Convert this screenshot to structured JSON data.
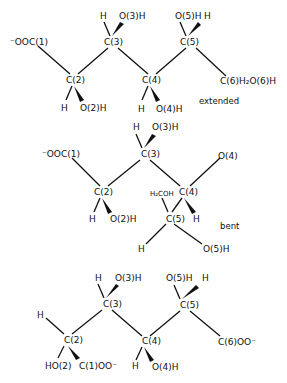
{
  "figure": {
    "structures": [
      {
        "id": "extended",
        "caption": "extended",
        "labels": {
          "c1": "⁻OOC(1)",
          "c2": "C(2)",
          "c3": "C(3)",
          "c4": "C(4)",
          "c5": "C(5)",
          "c6": "C(6)H₂O(6)H",
          "h2": "H",
          "o2": "O(2)H",
          "h3": "H",
          "o3": "O(3)H",
          "h4": "H",
          "o4": "O(4)H",
          "o5": "O(5)H",
          "h5": "H"
        }
      },
      {
        "id": "bent",
        "caption": "bent",
        "labels": {
          "c1": "⁻OOC(1)",
          "c2": "C(2)",
          "c3": "C(3)",
          "c4": "C(4)",
          "c5": "C(5)",
          "h2": "H",
          "o2": "O(2)H",
          "h3": "H",
          "o3": "O(3)H",
          "o4": "O(4)",
          "h4": "H",
          "h2coh": "H₂COH",
          "h5": "H",
          "o5": "O(5)H"
        }
      },
      {
        "id": "third",
        "caption": "",
        "labels": {
          "c2": "C(2)",
          "c3": "C(3)",
          "c4": "C(4)",
          "c5": "C(5)",
          "c6": "C(6)OO⁻",
          "h2": "H",
          "ho2": "HO(2)",
          "c1": "C(1)OO⁻",
          "h3": "H",
          "o3": "O(3)H",
          "h4": "H",
          "o4": "O(4)H",
          "o5": "O(5)H",
          "h5": "H"
        }
      }
    ]
  }
}
